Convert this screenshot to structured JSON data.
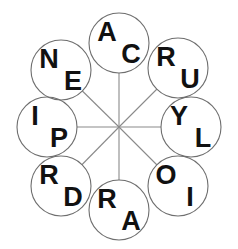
{
  "puzzle": {
    "title": "Letter Wheel",
    "background_color": "#ffffff",
    "circle_stroke_color": "#6e6e6e",
    "spoke_color": "#8a8a8a",
    "letter_color": "#111111",
    "center": {
      "x": 119,
      "y": 127
    },
    "node_radius": 30,
    "orbit_radius": 84,
    "nodes": [
      {
        "id": "node-top",
        "position": "top",
        "angle_deg": 270,
        "cx": 119,
        "cy": 43,
        "letters": [
          "A",
          "C"
        ],
        "letter_upper": "A",
        "letter_lower": "C",
        "pair": "AC"
      },
      {
        "id": "node-top-right",
        "position": "top-right",
        "angle_deg": 315,
        "cx": 178,
        "cy": 68,
        "letters": [
          "R",
          "U"
        ],
        "letter_upper": "R",
        "letter_lower": "U",
        "pair": "RU"
      },
      {
        "id": "node-right",
        "position": "right",
        "angle_deg": 0,
        "cx": 191,
        "cy": 127,
        "letters": [
          "Y",
          "L"
        ],
        "letter_upper": "Y",
        "letter_lower": "L",
        "pair": "YL"
      },
      {
        "id": "node-bottom-right",
        "position": "bottom-right",
        "angle_deg": 45,
        "cx": 178,
        "cy": 186,
        "letters": [
          "O",
          "I"
        ],
        "letter_upper": "O",
        "letter_lower": "I",
        "pair": "OI"
      },
      {
        "id": "node-bottom",
        "position": "bottom",
        "angle_deg": 90,
        "cx": 119,
        "cy": 210,
        "letters": [
          "R",
          "A"
        ],
        "letter_upper": "R",
        "letter_lower": "A",
        "pair": "RA"
      },
      {
        "id": "node-bottom-left",
        "position": "bottom-left",
        "angle_deg": 135,
        "cx": 61,
        "cy": 186,
        "letters": [
          "R",
          "D"
        ],
        "letter_upper": "R",
        "letter_lower": "D",
        "pair": "RD"
      },
      {
        "id": "node-left",
        "position": "left",
        "angle_deg": 180,
        "cx": 47,
        "cy": 127,
        "letters": [
          "I",
          "P"
        ],
        "letter_upper": "I",
        "letter_lower": "P",
        "pair": "IP"
      },
      {
        "id": "node-top-left",
        "position": "top-left",
        "angle_deg": 225,
        "cx": 61,
        "cy": 70,
        "letters": [
          "N",
          "E"
        ],
        "letter_upper": "N",
        "letter_lower": "E",
        "pair": "NE"
      }
    ],
    "letters_clockwise_from_top": [
      "A",
      "C",
      "R",
      "U",
      "Y",
      "L",
      "O",
      "I",
      "R",
      "A",
      "R",
      "D",
      "I",
      "P",
      "N",
      "E"
    ],
    "letter_offsets": {
      "upper_dx": -12,
      "upper_dy": -11,
      "lower_dx": 12,
      "lower_dy": 11
    }
  }
}
